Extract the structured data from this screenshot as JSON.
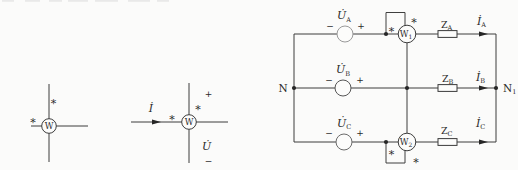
{
  "colors": {
    "background": "#fbfbfa",
    "wire": "#3d3d3d",
    "source_circle_light": "#9a9a9a",
    "text": "#2b2b2b"
  },
  "symbols": {
    "asterisk": "*",
    "plus": "+",
    "minus": "−",
    "wattmeter": "W"
  },
  "standalone_meters": {
    "meter2": {
      "current": "İ",
      "voltage": "U̇",
      "plus": "+",
      "minus": "−"
    }
  },
  "circuit": {
    "left_node": "N",
    "right_node": {
      "main": "N",
      "sub": "1"
    },
    "sources": [
      {
        "main": "U̇",
        "sub": "A"
      },
      {
        "main": "U̇",
        "sub": "B"
      },
      {
        "main": "U̇",
        "sub": "C"
      }
    ],
    "wattmeters": [
      {
        "main": "W",
        "sub": "1"
      },
      {
        "main": "W",
        "sub": "2"
      }
    ],
    "impedances": [
      {
        "main": "Z",
        "sub": "A"
      },
      {
        "main": "Z",
        "sub": "B"
      },
      {
        "main": "Z",
        "sub": "C"
      }
    ],
    "currents": [
      {
        "main": "İ",
        "sub": "A"
      },
      {
        "main": "İ",
        "sub": "B"
      },
      {
        "main": "İ",
        "sub": "C"
      }
    ]
  }
}
